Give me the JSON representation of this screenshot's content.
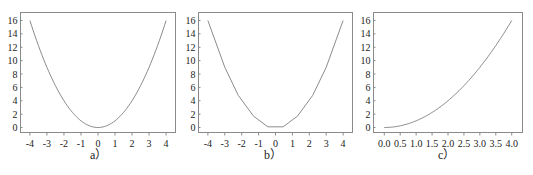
{
  "chart_data": [
    {
      "type": "line",
      "caption": "a）",
      "title": "",
      "xlabel": "",
      "ylabel": "",
      "xlim": [
        -4.2,
        4.2
      ],
      "ylim": [
        -0.8,
        17
      ],
      "xticks": [
        -4,
        -3,
        -2,
        -1,
        0,
        1,
        2,
        3,
        4
      ],
      "yticks": [
        0,
        2,
        4,
        6,
        8,
        10,
        12,
        14,
        16
      ],
      "grid": false,
      "description": "smooth parabola y = x^2",
      "x": [
        -4,
        -3.5,
        -3,
        -2.5,
        -2,
        -1.5,
        -1,
        -0.5,
        0,
        0.5,
        1,
        1.5,
        2,
        2.5,
        3,
        3.5,
        4
      ],
      "y": [
        16,
        12.25,
        9,
        6.25,
        4,
        2.25,
        1,
        0.25,
        0,
        0.25,
        1,
        2.25,
        4,
        6.25,
        9,
        12.25,
        16
      ]
    },
    {
      "type": "line",
      "caption": "b）",
      "title": "",
      "xlabel": "",
      "ylabel": "",
      "xlim": [
        -4.2,
        4.2
      ],
      "ylim": [
        -0.8,
        17
      ],
      "xticks": [
        -4,
        -3,
        -2,
        -1,
        0,
        1,
        2,
        3,
        4
      ],
      "yticks": [
        0,
        2,
        4,
        6,
        8,
        10,
        12,
        14,
        16
      ],
      "grid": false,
      "description": "coarse piecewise-linear approximation of y = x^2",
      "x": [
        -4,
        -3,
        -2.2,
        -1.3,
        -0.45,
        0.45,
        1.3,
        2.2,
        3,
        4
      ],
      "y": [
        16,
        9,
        4.8,
        1.7,
        0.1,
        0.1,
        1.7,
        4.8,
        9,
        16
      ]
    },
    {
      "type": "line",
      "caption": "c）",
      "title": "",
      "xlabel": "",
      "ylabel": "",
      "xlim": [
        -0.15,
        4.15
      ],
      "ylim": [
        -0.8,
        17
      ],
      "xticks": [
        0.0,
        0.5,
        1.0,
        1.5,
        2.0,
        2.5,
        3.0,
        3.5,
        4.0
      ],
      "yticks": [
        0,
        2,
        4,
        6,
        8,
        10,
        12,
        14,
        16
      ],
      "grid": false,
      "description": "right half of parabola y = x^2 for x in [0, 4]",
      "x": [
        0,
        0.5,
        1.0,
        1.5,
        2.0,
        2.5,
        3.0,
        3.5,
        4.0
      ],
      "y": [
        0,
        0.25,
        1,
        2.25,
        4,
        6.25,
        9,
        12.25,
        16
      ]
    }
  ],
  "panels": [
    {
      "caption": "a）",
      "xtick_labels": [
        "-4",
        "-3",
        "-2",
        "-1",
        "0",
        "1",
        "2",
        "3",
        "4"
      ],
      "ytick_labels": [
        "0",
        "2",
        "4",
        "6",
        "8",
        "10",
        "12",
        "14",
        "16"
      ]
    },
    {
      "caption": "b）",
      "xtick_labels": [
        "-4",
        "-3",
        "-2",
        "-1",
        "0",
        "1",
        "2",
        "3",
        "4"
      ],
      "ytick_labels": [
        "0",
        "2",
        "4",
        "6",
        "8",
        "10",
        "12",
        "14",
        "16"
      ]
    },
    {
      "caption": "c）",
      "xtick_labels": [
        "0.0",
        "0.5",
        "1.0",
        "1.5",
        "2.0",
        "2.5",
        "3.0",
        "3.5",
        "4.0"
      ],
      "ytick_labels": [
        "0",
        "2",
        "4",
        "6",
        "8",
        "10",
        "12",
        "14",
        "16"
      ]
    }
  ],
  "colors": {
    "frame": "#8a8a8a",
    "curve": "#8c8c8c",
    "text": "#222222",
    "background": "#ffffff"
  }
}
